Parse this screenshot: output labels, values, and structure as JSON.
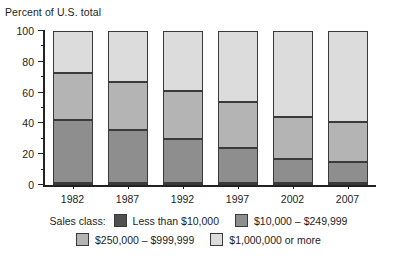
{
  "chart_data": {
    "type": "bar",
    "subtype": "stacked-bar-100",
    "title": "",
    "ylabel": "Percent of U.S. total",
    "xlabel": "",
    "ylim": [
      0,
      100
    ],
    "yticks": [
      0,
      20,
      40,
      60,
      80,
      100
    ],
    "ytick_labels": [
      "0",
      "20",
      "40",
      "60",
      "80",
      "100"
    ],
    "yminor_ticks": [
      10,
      30,
      50,
      70,
      90
    ],
    "grid": false,
    "legend_position": "bottom",
    "legend_lead": "Sales class:",
    "categories": [
      "1982",
      "1987",
      "1992",
      "1997",
      "2002",
      "2007"
    ],
    "series": [
      {
        "name": "Less than $10,000",
        "color": "#4f4f4f",
        "values": [
          1.5,
          1.3,
          1.2,
          1.2,
          1.0,
          1.0
        ]
      },
      {
        "name": "$10,000 – $249,999",
        "color": "#8e8e8e",
        "values": [
          41.0,
          34.7,
          28.8,
          22.8,
          16.0,
          14.0
        ]
      },
      {
        "name": "$250,000 – $999,999",
        "color": "#b4b4b4",
        "values": [
          30.0,
          31.0,
          31.0,
          30.0,
          27.0,
          26.0
        ]
      },
      {
        "name": "$1,000,000 or more",
        "color": "#dcdcdc",
        "values": [
          27.5,
          33.0,
          39.0,
          46.0,
          56.0,
          59.0
        ]
      }
    ],
    "cumulative_boundaries": {
      "1982": [
        1.5,
        42.5,
        72.5,
        100
      ],
      "1987": [
        1.3,
        36.0,
        67.0,
        100
      ],
      "1992": [
        1.2,
        30.0,
        61.0,
        100
      ],
      "1997": [
        1.2,
        24.0,
        54.0,
        100
      ],
      "2002": [
        1.0,
        17.0,
        44.0,
        100
      ],
      "2007": [
        1.0,
        15.0,
        41.0,
        100
      ]
    }
  },
  "legend": {
    "lead": "Sales class:",
    "rows": [
      [
        {
          "label": "Less than $10,000",
          "color": "#4f4f4f"
        },
        {
          "label": "$10,000 – $249,999",
          "color": "#8e8e8e"
        }
      ],
      [
        {
          "label": "$250,000 – $999,999",
          "color": "#b4b4b4"
        },
        {
          "label": "$1,000,000 or more",
          "color": "#dcdcdc"
        }
      ]
    ]
  }
}
